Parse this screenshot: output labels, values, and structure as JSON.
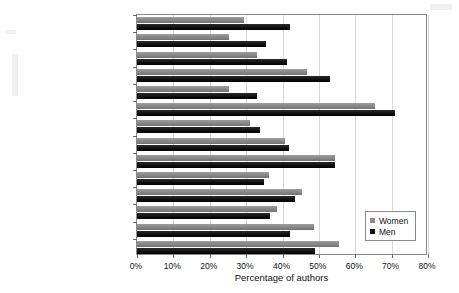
{
  "chart_data": {
    "type": "bar",
    "orientation": "horizontal",
    "title": "",
    "xlabel": "Percentage of authors",
    "ylabel": "",
    "xlim": [
      0,
      80
    ],
    "xticks": [
      "0%",
      "10%",
      "20%",
      "30%",
      "40%",
      "50%",
      "60%",
      "70%",
      "80%"
    ],
    "xtick_values": [
      0,
      10,
      20,
      30,
      40,
      50,
      60,
      70,
      80
    ],
    "grid": true,
    "grid_axis": "x",
    "legend_position": "lower right",
    "categories": [
      "Supervision",
      "Funding acquisition",
      "Resources",
      "Conceptualization",
      "Software",
      "Writing—review & editing",
      "Project administration",
      "Validation",
      "Methodology",
      "Visualization",
      "Formal analysis",
      "Writing—original draft",
      "Data curation",
      "Investigation"
    ],
    "series": [
      {
        "name": "Women",
        "color": "#8a8a8a",
        "values": [
          29.3,
          25.4,
          32.9,
          46.7,
          25.4,
          65.5,
          31.0,
          40.7,
          54.4,
          36.2,
          45.3,
          38.4,
          48.6,
          55.5
        ]
      },
      {
        "name": "Men",
        "color": "#111111",
        "values": [
          42.0,
          35.6,
          41.2,
          53.0,
          32.9,
          71.0,
          33.8,
          41.7,
          54.4,
          34.8,
          43.4,
          36.5,
          42.0,
          48.9
        ]
      }
    ]
  },
  "legend": {
    "items": [
      {
        "label": "Women",
        "color": "#8a8a8a"
      },
      {
        "label": "Men",
        "color": "#111111"
      }
    ]
  }
}
